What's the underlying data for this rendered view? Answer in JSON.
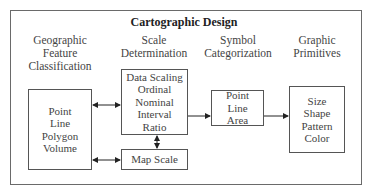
{
  "diagram": {
    "title": "Cartographic Design",
    "columns": [
      {
        "heading": [
          "Geographic",
          "Feature",
          "Classification"
        ]
      },
      {
        "heading": [
          "Scale",
          "Determination"
        ]
      },
      {
        "heading": [
          "Symbol",
          "Categorization"
        ]
      },
      {
        "heading": [
          "Graphic",
          "Primitives"
        ]
      }
    ],
    "boxes": {
      "features": [
        "Point",
        "Line",
        "Polygon",
        "Volume"
      ],
      "data_scaling": [
        "Data Scaling",
        "Ordinal",
        "Nominal",
        "Interval",
        "Ratio"
      ],
      "map_scale": [
        "Map Scale"
      ],
      "symbols": [
        "Point",
        "Line",
        "Area"
      ],
      "primitives": [
        "Size",
        "Shape",
        "Pattern",
        "Color"
      ]
    },
    "edges": [
      {
        "from": "features",
        "to": "data_scaling",
        "type": "bidirectional"
      },
      {
        "from": "features",
        "to": "map_scale",
        "type": "bidirectional"
      },
      {
        "from": "data_scaling",
        "to": "map_scale",
        "type": "bidirectional"
      },
      {
        "from": "data_scaling",
        "to": "symbols",
        "type": "directed"
      },
      {
        "from": "symbols",
        "to": "primitives",
        "type": "directed"
      }
    ]
  }
}
